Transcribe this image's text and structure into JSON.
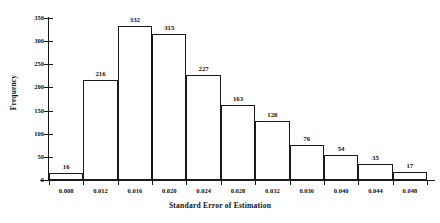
{
  "chart_data": {
    "type": "bar",
    "title": "",
    "subtitle": "",
    "xlabel": "Standard Error of Estimation",
    "ylabel": "Frequency",
    "categories": [
      "0.008",
      "0.012",
      "0.016",
      "0.020",
      "0.024",
      "0.028",
      "0.032",
      "0.036",
      "0.040",
      "0.044",
      "0.048"
    ],
    "values": [
      16,
      216,
      332,
      315,
      227,
      163,
      128,
      76,
      54,
      35,
      17
    ],
    "data_labels": [
      "16",
      "216",
      "332",
      "315",
      "227",
      "163",
      "128",
      "76",
      "54",
      "35",
      "17"
    ],
    "xtick_labels": [
      "0.008",
      "0.012",
      "0.016",
      "0.020",
      "0.024",
      "0.028",
      "0.032",
      "0.036",
      "0.040",
      "0.044",
      "0.048"
    ],
    "ytick_labels": [
      "0",
      "50",
      "100",
      "150",
      "200",
      "250",
      "300",
      "350"
    ],
    "ytick_values": [
      0,
      50,
      100,
      150,
      200,
      250,
      300,
      350
    ],
    "ylim": [
      0,
      350
    ],
    "grid": false,
    "legend": null,
    "bar_fill_color": "#ffffff",
    "bar_edge_color": "#1a1a1a",
    "axis_color": "#1a1a1a",
    "text_color": "#111111",
    "background_color": "#ffffff"
  }
}
